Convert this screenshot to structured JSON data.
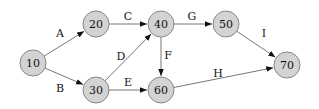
{
  "diagram": {
    "type": "directed-graph",
    "colors": {
      "node_fill": "#d3d3d3",
      "node_stroke": "#888888",
      "edge": "#777777",
      "arrowhead": "#111111",
      "text": "#111111"
    },
    "node_radius": 13,
    "nodes": [
      {
        "id": "n10",
        "label": "10",
        "x": 33,
        "y": 63
      },
      {
        "id": "n20",
        "label": "20",
        "x": 96,
        "y": 24
      },
      {
        "id": "n30",
        "label": "30",
        "x": 96,
        "y": 90
      },
      {
        "id": "n40",
        "label": "40",
        "x": 161,
        "y": 24
      },
      {
        "id": "n50",
        "label": "50",
        "x": 226,
        "y": 24
      },
      {
        "id": "n60",
        "label": "60",
        "x": 161,
        "y": 90
      },
      {
        "id": "n70",
        "label": "70",
        "x": 287,
        "y": 65
      }
    ],
    "edges": [
      {
        "label": "A",
        "from": "n10",
        "to": "n20",
        "lx": 60,
        "ly": 33
      },
      {
        "label": "B",
        "from": "n10",
        "to": "n30",
        "lx": 60,
        "ly": 88
      },
      {
        "label": "C",
        "from": "n20",
        "to": "n40",
        "lx": 128,
        "ly": 16
      },
      {
        "label": "D",
        "from": "n30",
        "to": "n40",
        "lx": 121,
        "ly": 56
      },
      {
        "label": "E",
        "from": "n30",
        "to": "n60",
        "lx": 128,
        "ly": 82
      },
      {
        "label": "F",
        "from": "n40",
        "to": "n60",
        "lx": 168,
        "ly": 55
      },
      {
        "label": "G",
        "from": "n40",
        "to": "n50",
        "lx": 192,
        "ly": 16
      },
      {
        "label": "H",
        "from": "n60",
        "to": "n70",
        "lx": 218,
        "ly": 73
      },
      {
        "label": "I",
        "from": "n50",
        "to": "n70",
        "lx": 264,
        "ly": 33
      }
    ]
  }
}
